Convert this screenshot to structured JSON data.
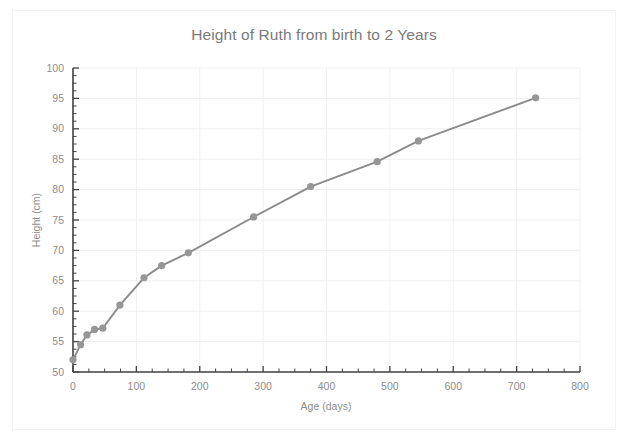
{
  "chart_data": {
    "type": "line",
    "title": "Height of Ruth from birth to 2 Years",
    "xlabel": "Age (days)",
    "ylabel": "Height (cm)",
    "xlim": [
      0,
      800
    ],
    "ylim": [
      50,
      100
    ],
    "x_ticks": [
      0,
      100,
      200,
      300,
      400,
      500,
      600,
      700,
      800
    ],
    "y_ticks": [
      50,
      55,
      60,
      65,
      70,
      75,
      80,
      85,
      90,
      95,
      100
    ],
    "x_tick_labels": [
      "0",
      "100",
      "200",
      "300",
      "400",
      "500",
      "600",
      "700",
      "800"
    ],
    "y_tick_labels": [
      "50",
      "55",
      "60",
      "65",
      "70",
      "75",
      "80",
      "85",
      "90",
      "95",
      "100"
    ],
    "x_minor_tick_step": 25,
    "y_minor_tick_step": 1.25,
    "grid": true,
    "grid_axis": "both",
    "legend": false,
    "legend_position": "none",
    "marker": "circle",
    "line_color": "#8a8a8a",
    "marker_color": "#969696",
    "grid_color": "#f0f0f2",
    "axis_color": "#404040",
    "text_color": "#8c8c8c",
    "background_color": "#ffffff",
    "series": [
      {
        "name": "Height of Ruth",
        "x": [
          0,
          12,
          22,
          34,
          47,
          74,
          112,
          140,
          182,
          285,
          375,
          480,
          545,
          730
        ],
        "values": [
          52.0,
          54.5,
          56.1,
          57.0,
          57.2,
          61.0,
          65.5,
          67.5,
          69.6,
          75.5,
          80.5,
          84.6,
          88.0,
          95.1
        ]
      }
    ],
    "points": [
      {
        "x": 0,
        "y": 52.0
      },
      {
        "x": 12,
        "y": 54.5
      },
      {
        "x": 22,
        "y": 56.1
      },
      {
        "x": 34,
        "y": 57.0
      },
      {
        "x": 47,
        "y": 57.2
      },
      {
        "x": 74,
        "y": 61.0
      },
      {
        "x": 112,
        "y": 65.5
      },
      {
        "x": 140,
        "y": 67.5
      },
      {
        "x": 182,
        "y": 69.6
      },
      {
        "x": 285,
        "y": 75.5
      },
      {
        "x": 375,
        "y": 80.5
      },
      {
        "x": 480,
        "y": 84.6
      },
      {
        "x": 545,
        "y": 88.0
      },
      {
        "x": 730,
        "y": 95.1
      }
    ]
  }
}
